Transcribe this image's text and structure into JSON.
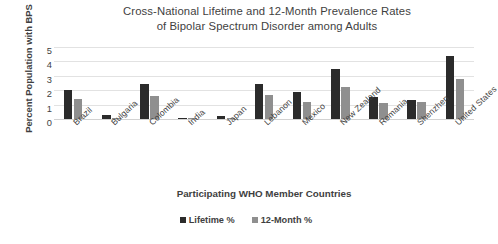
{
  "chart_data": {
    "type": "bar",
    "title": "Cross-National Lifetime and 12-Month Prevalence Rates of Bipolar Spectrum Disorder among Adults",
    "title_lines": [
      "Cross-National Lifetime and 12-Month Prevalence Rates",
      "of Bipolar Spectrum Disorder  among Adults"
    ],
    "xlabel": "Participating WHO Member Countries",
    "ylabel": "Percent Population with BPS",
    "ylim": [
      0,
      5
    ],
    "yticks": [
      5,
      4,
      3,
      2,
      1,
      0
    ],
    "grid": true,
    "legend_position": "bottom",
    "categories": [
      "Brazil",
      "Bulgaria",
      "Colombia",
      "India",
      "Japan",
      "Lebanon",
      "Mexico",
      "New Zealand",
      "Romania",
      "Shenzhen",
      "United States"
    ],
    "series": [
      {
        "name": "Lifetime %",
        "color": "#2b2b2b",
        "values": [
          2.0,
          0.3,
          2.4,
          0.1,
          0.2,
          2.4,
          1.9,
          3.5,
          1.5,
          1.3,
          4.4
        ]
      },
      {
        "name": "12-Month %",
        "color": "#8f8f8f",
        "values": [
          1.4,
          0.1,
          1.6,
          0.1,
          0.1,
          1.7,
          1.2,
          2.2,
          1.1,
          1.2,
          2.8
        ]
      }
    ]
  },
  "legend": {
    "items": [
      {
        "label": "Lifetime %",
        "color": "#2b2b2b"
      },
      {
        "label": "12-Month %",
        "color": "#8f8f8f"
      }
    ]
  }
}
